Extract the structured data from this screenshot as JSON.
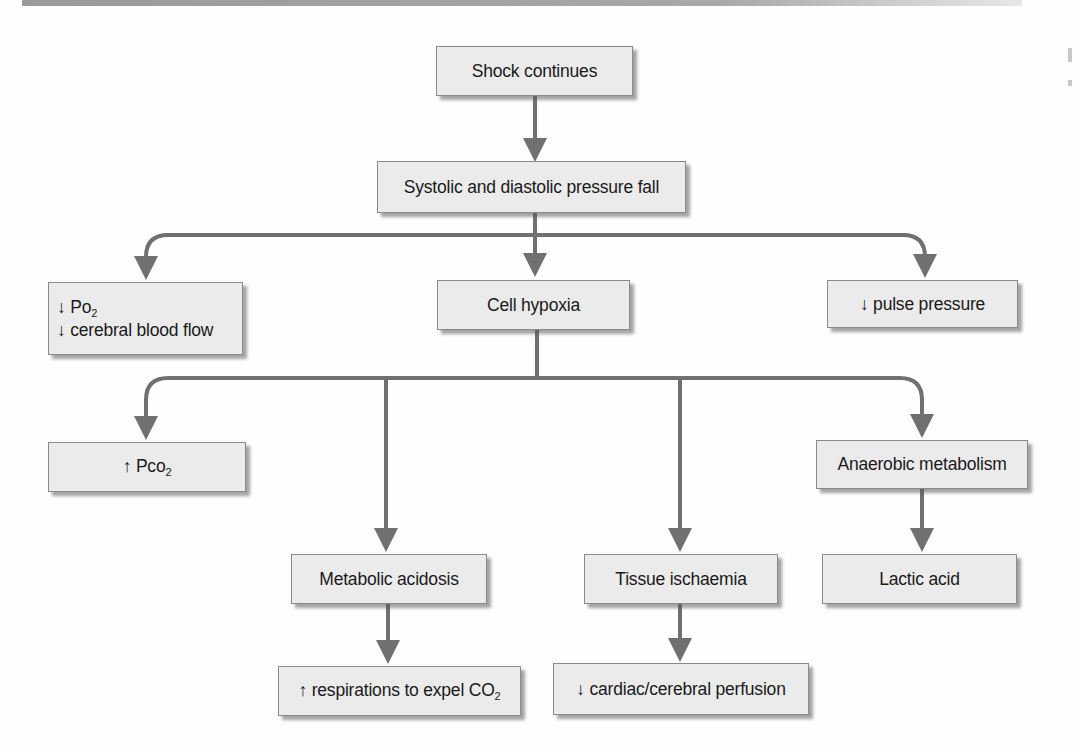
{
  "diagram": {
    "type": "flowchart",
    "colors": {
      "box_fill": "#ebebeb",
      "box_border": "#8a8a8a",
      "arrow": "#707070",
      "text": "#1a1a1a"
    },
    "nodes": {
      "shock": {
        "label": "Shock continues"
      },
      "pressure": {
        "label": "Systolic and diastolic pressure fall"
      },
      "po2": {
        "line1_arrow": "↓",
        "line1_text": "Po",
        "line1_sub": "2",
        "line2": "↓ cerebral blood flow"
      },
      "hypoxia": {
        "label": "Cell hypoxia"
      },
      "pulse": {
        "label": "↓ pulse pressure"
      },
      "pco2": {
        "arrow": "↑",
        "text": "Pco",
        "sub": "2"
      },
      "anaerobic": {
        "label": "Anaerobic metabolism"
      },
      "acidosis": {
        "label": "Metabolic acidosis"
      },
      "ischaemia": {
        "label": "Tissue ischaemia"
      },
      "lactic": {
        "label": "Lactic acid"
      },
      "respirations": {
        "text": "↑ respirations to expel CO",
        "sub": "2"
      },
      "perfusion": {
        "label": "↓ cardiac/cerebral perfusion"
      }
    },
    "edges": [
      [
        "Shock continues",
        "Systolic and diastolic pressure fall"
      ],
      [
        "Systolic and diastolic pressure fall",
        "↓ Po2 / ↓ cerebral blood flow"
      ],
      [
        "Systolic and diastolic pressure fall",
        "Cell hypoxia"
      ],
      [
        "Systolic and diastolic pressure fall",
        "↓ pulse pressure"
      ],
      [
        "Cell hypoxia",
        "↑ Pco2"
      ],
      [
        "Cell hypoxia",
        "Metabolic acidosis"
      ],
      [
        "Cell hypoxia",
        "Tissue ischaemia"
      ],
      [
        "Cell hypoxia",
        "Anaerobic metabolism"
      ],
      [
        "Anaerobic metabolism",
        "Lactic acid"
      ],
      [
        "Metabolic acidosis",
        "↑ respirations to expel CO2"
      ],
      [
        "Tissue ischaemia",
        "↓ cardiac/cerebral perfusion"
      ]
    ]
  }
}
